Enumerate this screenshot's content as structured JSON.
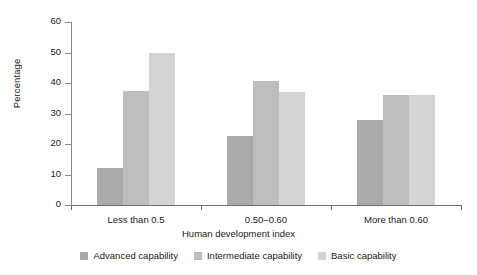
{
  "chart_data": {
    "type": "bar",
    "title": "",
    "xlabel": "Human development index",
    "ylabel": "Percentage",
    "categories": [
      "Less than 0.5",
      "0.50–0.60",
      "More than 0.60"
    ],
    "series": [
      {
        "name": "Advanced capability",
        "color": "#a9a9a9",
        "values": [
          12,
          22.5,
          28
        ]
      },
      {
        "name": "Intermediate capability",
        "color": "#bdbdbd",
        "values": [
          37.5,
          40.5,
          36
        ]
      },
      {
        "name": "Basic capability",
        "color": "#d4d4d4",
        "values": [
          50,
          37,
          36
        ]
      }
    ],
    "ylim": [
      0,
      60
    ],
    "yticks": [
      0,
      10,
      20,
      30,
      40,
      50,
      60
    ],
    "ytick_labels": [
      "0",
      "10",
      "20",
      "30",
      "40",
      "50",
      "60"
    ],
    "grid": false,
    "legend_position": "bottom"
  }
}
